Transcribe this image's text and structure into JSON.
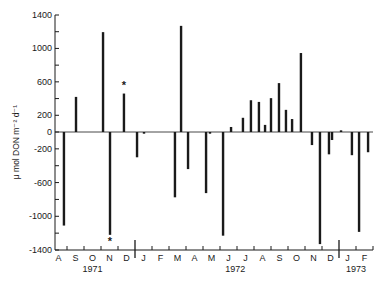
{
  "chart_data": {
    "type": "bar",
    "title": "",
    "xlabel": "",
    "ylabel": "μ mol DON m⁻² d⁻¹",
    "ylim": [
      -1400,
      1400
    ],
    "yticks": [
      1400,
      1000,
      600,
      200,
      0,
      -200,
      -600,
      -1000,
      -1400
    ],
    "yminor_step": 200,
    "grid": false,
    "legend": null,
    "months": [
      "A",
      "S",
      "O",
      "N",
      "D",
      "J",
      "F",
      "M",
      "A",
      "M",
      "J",
      "J",
      "A",
      "S",
      "O",
      "N",
      "D",
      "J",
      "F"
    ],
    "years": [
      {
        "label": "1971",
        "center_month": 2.5
      },
      {
        "label": "1972",
        "center_month": 10.9
      },
      {
        "label": "1973",
        "center_month": 18.0
      }
    ],
    "year_dividers": [
      5,
      17
    ],
    "bars": [
      {
        "month_pos": 0.82,
        "value": -1110
      },
      {
        "month_pos": 1.53,
        "value": 420
      },
      {
        "month_pos": 3.12,
        "value": 1195
      },
      {
        "month_pos": 3.53,
        "value": -1220,
        "marker": "*"
      },
      {
        "month_pos": 4.35,
        "value": 460,
        "marker": "*"
      },
      {
        "month_pos": 5.12,
        "value": -300
      },
      {
        "month_pos": 5.53,
        "value": -20
      },
      {
        "month_pos": 7.35,
        "value": -775
      },
      {
        "month_pos": 7.71,
        "value": 1270
      },
      {
        "month_pos": 8.12,
        "value": -440
      },
      {
        "month_pos": 9.18,
        "value": -725
      },
      {
        "month_pos": 9.41,
        "value": -20
      },
      {
        "month_pos": 10.18,
        "value": -1230
      },
      {
        "month_pos": 10.65,
        "value": 60
      },
      {
        "month_pos": 11.35,
        "value": 170
      },
      {
        "month_pos": 11.82,
        "value": 380
      },
      {
        "month_pos": 12.29,
        "value": 360
      },
      {
        "month_pos": 12.65,
        "value": 85
      },
      {
        "month_pos": 13.0,
        "value": 405
      },
      {
        "month_pos": 13.47,
        "value": 585
      },
      {
        "month_pos": 13.88,
        "value": 265
      },
      {
        "month_pos": 14.24,
        "value": 155
      },
      {
        "month_pos": 14.76,
        "value": 945
      },
      {
        "month_pos": 15.41,
        "value": -155
      },
      {
        "month_pos": 15.88,
        "value": -1330
      },
      {
        "month_pos": 16.41,
        "value": -265
      },
      {
        "month_pos": 16.59,
        "value": -95
      },
      {
        "month_pos": 17.12,
        "value": 20
      },
      {
        "month_pos": 17.76,
        "value": -275
      },
      {
        "month_pos": 18.18,
        "value": -1185
      },
      {
        "month_pos": 18.71,
        "value": -240
      }
    ],
    "annotations": [
      "* asterisk above Dec 1971 positive bar",
      "* asterisk below Nov 1971 negative bar"
    ]
  },
  "colors": {
    "ink": "#1a1a1a",
    "background": "#ffffff"
  }
}
